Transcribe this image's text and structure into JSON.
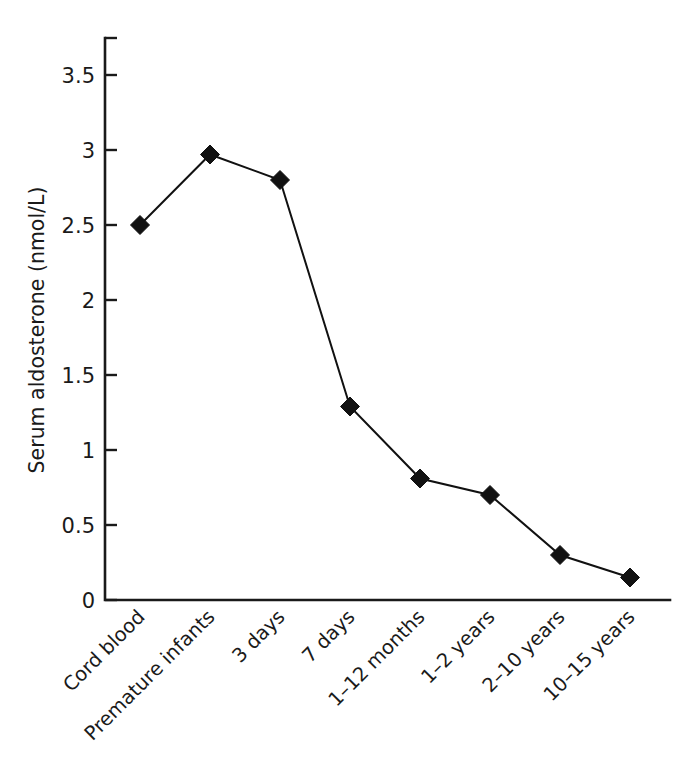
{
  "chart_data": {
    "type": "line",
    "title": "",
    "subtitle": "",
    "xlabel": "",
    "ylabel": "Serum aldosterone (nmol/L)",
    "categories": [
      "Cord blood",
      "Premature infants",
      "3 days",
      "7 days",
      "1–12 months",
      "1–2 years",
      "2–10 years",
      "10–15 years"
    ],
    "values": [
      2.5,
      2.97,
      2.8,
      1.29,
      0.81,
      0.7,
      0.3,
      0.15
    ],
    "series": [
      {
        "name": "Serum aldosterone",
        "values": [
          2.5,
          2.97,
          2.8,
          1.29,
          0.81,
          0.7,
          0.3,
          0.15
        ]
      }
    ],
    "ylim": [
      0,
      4
    ],
    "yticks": [
      0,
      0.5,
      1,
      1.5,
      2,
      2.5,
      3,
      3.5
    ],
    "ytick_labels": [
      "0",
      "0.5",
      "1",
      "1.5",
      "2",
      "2.5",
      "3",
      "3.5"
    ],
    "grid": false,
    "legend": false,
    "legend_position": "none",
    "marker": "diamond",
    "line_color": "#111111",
    "marker_color": "#111111",
    "axis_color": "#1a1a1a",
    "background_color": "#ffffff",
    "xtick_label_rotation": 45
  }
}
